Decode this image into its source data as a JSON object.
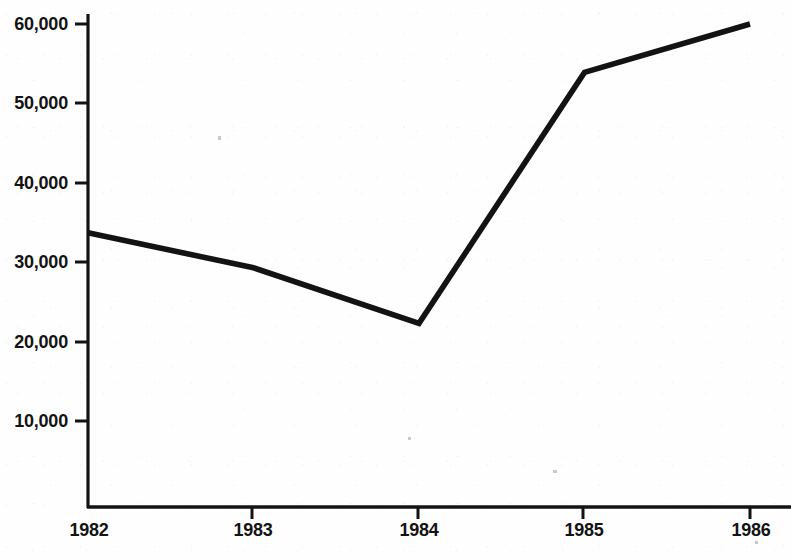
{
  "chart_data": {
    "type": "line",
    "title": "",
    "xlabel": "",
    "ylabel": "",
    "x": [
      1982,
      1983,
      1984,
      1985,
      1986
    ],
    "categories": [
      "1982",
      "1983",
      "1984",
      "1985",
      "1986"
    ],
    "values": [
      33700,
      29300,
      22300,
      53900,
      60000
    ],
    "series": [
      {
        "name": "",
        "values": [
          33700,
          29300,
          22300,
          53900,
          60000
        ]
      }
    ],
    "xlim": [
      1982,
      1986
    ],
    "ylim": [
      0,
      60000
    ],
    "grid": false,
    "legend": false,
    "legend_position": "none",
    "y_ticks": [
      10000,
      20000,
      30000,
      40000,
      50000,
      60000
    ],
    "y_tick_labels": [
      "10,000",
      "20,000",
      "30,000",
      "40,000",
      "50,000",
      "60,000"
    ],
    "x_ticks": [
      1982,
      1983,
      1984,
      1985,
      1986
    ],
    "x_tick_labels": [
      "1982",
      "1983",
      "1984",
      "1985",
      "1986"
    ],
    "line_color": "#131313",
    "background_color": "#fefefe",
    "axis_color": "#131313"
  },
  "axes": {
    "y_labels": [
      {
        "text": "60,000",
        "value": 60000
      },
      {
        "text": "50,000",
        "value": 50000
      },
      {
        "text": "40,000",
        "value": 40000
      },
      {
        "text": "30,000",
        "value": 30000
      },
      {
        "text": "20,000",
        "value": 20000
      },
      {
        "text": "10,000",
        "value": 10000
      }
    ],
    "x_labels": [
      {
        "text": "1982",
        "value": 1982
      },
      {
        "text": "1983",
        "value": 1983
      },
      {
        "text": "1984",
        "value": 1984
      },
      {
        "text": "1985",
        "value": 1985
      },
      {
        "text": "1986",
        "value": 1986
      }
    ]
  }
}
